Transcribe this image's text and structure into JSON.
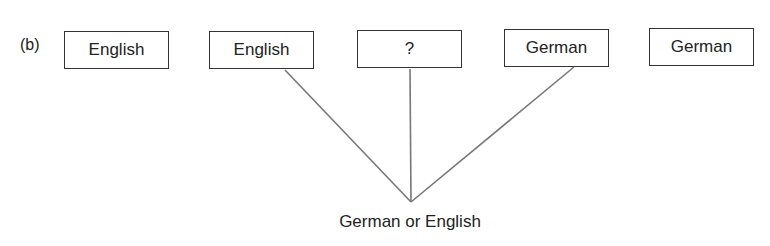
{
  "panel_label": "(b)",
  "boxes": [
    {
      "label": "English",
      "x": 64,
      "y": 31
    },
    {
      "label": "English",
      "x": 209,
      "y": 31
    },
    {
      "label": "?",
      "x": 357,
      "y": 30
    },
    {
      "label": "German",
      "x": 504,
      "y": 29
    },
    {
      "label": "German",
      "x": 649,
      "y": 28
    }
  ],
  "connections": {
    "sources": [
      1,
      2,
      3
    ],
    "apex": {
      "x": 411,
      "y": 202
    },
    "stroke_color": "#777777"
  },
  "result_label": "German or English"
}
